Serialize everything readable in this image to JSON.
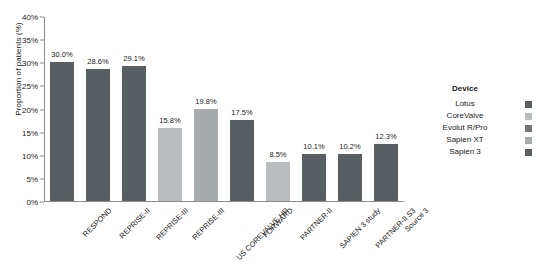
{
  "chart_data": {
    "type": "bar",
    "title": "",
    "xlabel": "",
    "ylabel": "Proportion of patients (%)",
    "ylim": [
      0,
      40
    ],
    "grid": false,
    "legend_position": "right",
    "ytick_labels": [
      "40%",
      "35%",
      "30%",
      "25%",
      "20%",
      "15%",
      "10%",
      "5%",
      "0%"
    ],
    "ytick_values": [
      40,
      35,
      30,
      25,
      20,
      15,
      10,
      5,
      0
    ],
    "categories": [
      "RESPOND",
      "REPRISE-II",
      "REPRISE-III",
      "REPRISE-III",
      "US COREVALVE HR",
      "FORWARD",
      "PARTNER-II",
      "SAPIEN 3 study",
      "PARTNER-II S3",
      "Source 3"
    ],
    "values": [
      30.0,
      28.6,
      29.1,
      15.8,
      19.8,
      17.5,
      8.5,
      10.1,
      10.2,
      12.3
    ],
    "value_labels": [
      "30.0%",
      "28.6%",
      "29.1%",
      "15.8%",
      "19.8%",
      "17.5%",
      "8.5%",
      "10.1%",
      "10.2%",
      "12.3%"
    ],
    "bar_devices": [
      "Lotus",
      "Lotus",
      "Lotus",
      "CoreValve",
      "Evolut R/Pro",
      "Evolut R/Pro",
      "Sapien XT",
      "Sapien 3",
      "Sapien 3",
      "Sapien 3"
    ],
    "bar_colors": [
      "#585f63",
      "#585f63",
      "#585f63",
      "#b9bdbf",
      "#a6abad",
      "#585f63",
      "#b9bdbf",
      "#585f63",
      "#585f63",
      "#585f63"
    ]
  },
  "legend": {
    "title": "Device",
    "items": [
      {
        "label": "Lotus",
        "color": "#585f63"
      },
      {
        "label": "CoreValve",
        "color": "#b9bdbf"
      },
      {
        "label": "Evolut R/Pro",
        "color": "#6e7477"
      },
      {
        "label": "Sapien XT",
        "color": "#a6abad"
      },
      {
        "label": "Sapien 3",
        "color": "#585f63"
      }
    ]
  },
  "axis": {
    "y_title": "Proportion of patients (%)"
  }
}
